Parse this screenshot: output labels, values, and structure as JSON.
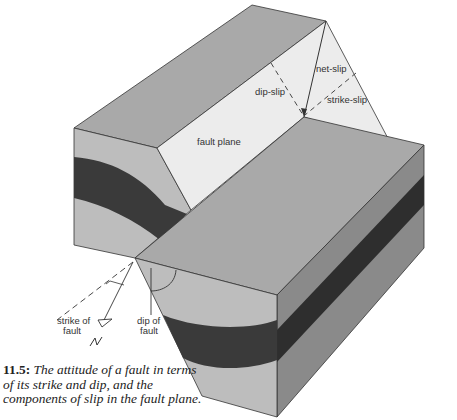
{
  "figure": {
    "labels": {
      "net_slip": "net-slip",
      "dip_slip": "dip-slip",
      "strike_slip": "strike-slip",
      "fault_plane": "fault plane",
      "strike_of_fault_line1": "strike of",
      "strike_of_fault_line2": "fault",
      "dip_of_fault_line1": "dip of",
      "dip_of_fault_line2": "fault",
      "north_symbol": "N"
    },
    "colors": {
      "top_face": "#a9a9a9",
      "front_face_light": "#bdbdbd",
      "side_face": "#8a8a8a",
      "dark_bed": "#3a3a3a",
      "fault_plane": "#ececec",
      "outline": "#333333"
    }
  },
  "caption": {
    "number": "11.5:",
    "text": "The attitude of a fault in terms of its strike and dip, and the components of slip in the fault plane."
  }
}
